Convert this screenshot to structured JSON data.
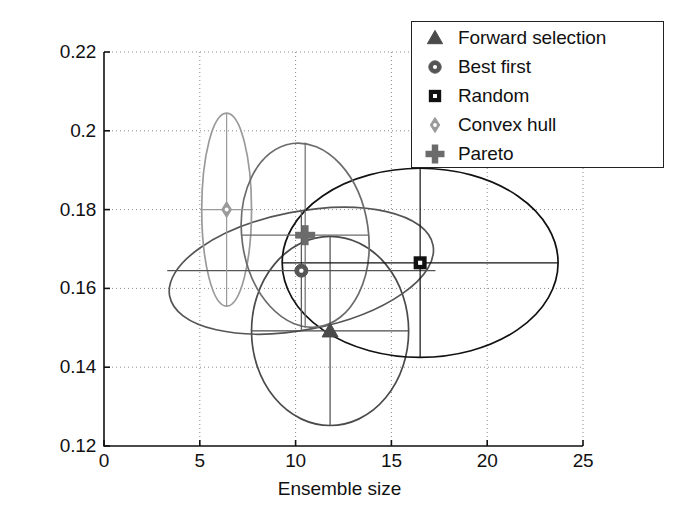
{
  "chart_data": {
    "type": "scatter",
    "title": "",
    "xlabel": "Ensemble size",
    "ylabel": "Ensemble classification error",
    "xlim": [
      0,
      25
    ],
    "ylim": [
      0.12,
      0.22
    ],
    "xticks": [
      "0",
      "5",
      "10",
      "15",
      "20",
      "25"
    ],
    "xtick_values": [
      0,
      5,
      10,
      15,
      20,
      25
    ],
    "yticks": [
      "0.12",
      "0.14",
      "0.16",
      "0.18",
      "0.2",
      "0.22"
    ],
    "ytick_values": [
      0.12,
      0.14,
      0.16,
      0.18,
      0.2,
      0.22
    ],
    "grid": true,
    "grid_style": "dotted",
    "legend_position": "top-right",
    "series": [
      {
        "name": "Forward selection",
        "marker": "triangle",
        "color": "#4a4a4a",
        "x": 11.8,
        "y": 0.1492,
        "ellipse": {
          "cx": 11.8,
          "cy": 0.1492,
          "rx": 4.1,
          "ry": 0.024,
          "angle": 0
        },
        "errorbar": {
          "x_low": 7.7,
          "x_high": 15.9,
          "y_low": 0.1252,
          "y_high": 0.1732
        }
      },
      {
        "name": "Best first",
        "marker": "circle",
        "color": "#555555",
        "x": 10.3,
        "y": 0.1645,
        "ellipse": {
          "cx": 10.3,
          "cy": 0.1645,
          "rx": 7.0,
          "ry": 0.015,
          "angle": -11
        },
        "errorbar": {
          "x_low": 3.3,
          "x_high": 17.3,
          "y_low": 0.1495,
          "y_high": 0.1795
        }
      },
      {
        "name": "Random",
        "marker": "square",
        "color": "#111111",
        "x": 16.5,
        "y": 0.1665,
        "ellipse": {
          "cx": 16.5,
          "cy": 0.1665,
          "rx": 7.2,
          "ry": 0.024,
          "angle": 0
        },
        "errorbar": {
          "x_low": 9.3,
          "x_high": 23.7,
          "y_low": 0.1425,
          "y_high": 0.1905
        }
      },
      {
        "name": "Convex hull",
        "marker": "diamond",
        "color": "#9a9a9a",
        "x": 6.4,
        "y": 0.18,
        "ellipse": {
          "cx": 6.4,
          "cy": 0.18,
          "rx": 1.3,
          "ry": 0.0245,
          "angle": 0
        },
        "errorbar": {
          "x_low": 5.1,
          "x_high": 7.7,
          "y_low": 0.1555,
          "y_high": 0.2045
        }
      },
      {
        "name": "Pareto",
        "marker": "plus",
        "color": "#6b6b6b",
        "x": 10.5,
        "y": 0.1735,
        "ellipse": {
          "cx": 10.5,
          "cy": 0.1735,
          "rx": 3.3,
          "ry": 0.0235,
          "angle": -8
        },
        "errorbar": {
          "x_low": 7.2,
          "x_high": 13.8,
          "y_low": 0.15,
          "y_high": 0.197
        }
      }
    ]
  },
  "legend": {
    "items": [
      {
        "label": "Forward selection",
        "marker": "triangle",
        "color": "#4a4a4a"
      },
      {
        "label": "Best first",
        "marker": "circle",
        "color": "#555555"
      },
      {
        "label": "Random",
        "marker": "square",
        "color": "#111111"
      },
      {
        "label": "Convex hull",
        "marker": "diamond",
        "color": "#9a9a9a"
      },
      {
        "label": "Pareto",
        "marker": "plus",
        "color": "#6b6b6b"
      }
    ]
  },
  "axes": {
    "xlabel": "Ensemble size",
    "ylabel": "Ensemble classification error"
  }
}
